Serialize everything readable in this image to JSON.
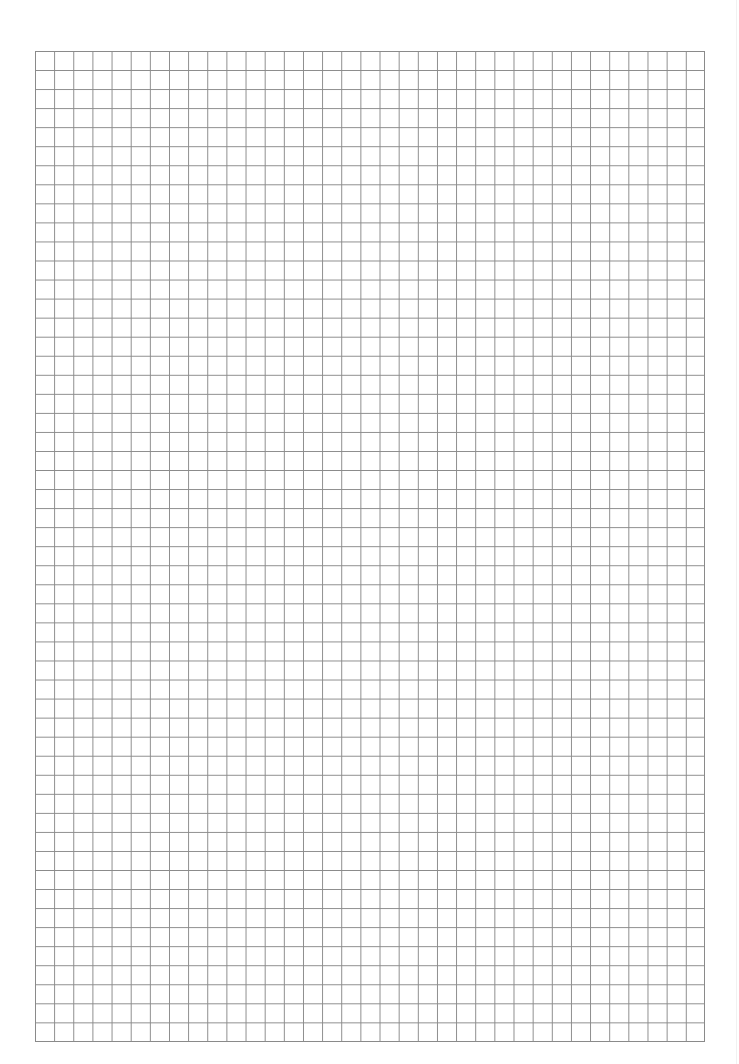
{
  "document": {
    "type": "graph-paper",
    "grid": {
      "columns": 35,
      "rows": 52,
      "line_color": "#8a8a8a",
      "background_color": "#ffffff"
    }
  }
}
